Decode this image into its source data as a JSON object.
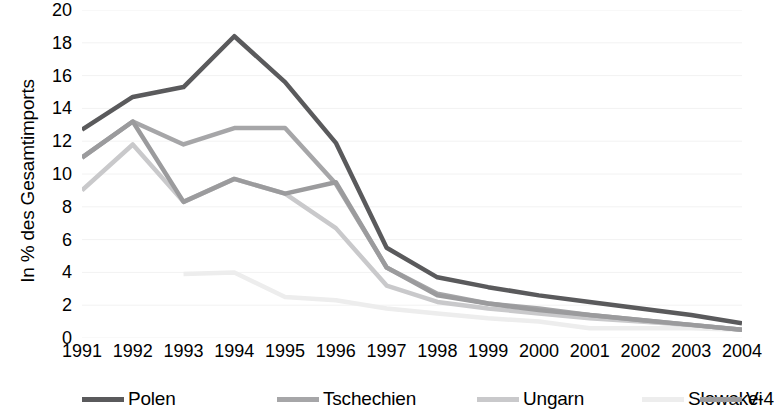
{
  "chart_data": {
    "type": "line",
    "title": "",
    "xlabel": "",
    "ylabel": "In % des Gesamtimports",
    "x": [
      1991,
      1992,
      1993,
      1994,
      1995,
      1996,
      1997,
      1998,
      1999,
      2000,
      2001,
      2002,
      2003,
      2004
    ],
    "categories": [
      "1991",
      "1992",
      "1993",
      "1994",
      "1995",
      "1996",
      "1997",
      "1998",
      "1999",
      "2000",
      "2001",
      "2002",
      "2003",
      "2004"
    ],
    "xlim": [
      1991,
      2004
    ],
    "ylim": [
      0,
      20
    ],
    "yticks": [
      0,
      2,
      4,
      6,
      8,
      10,
      12,
      14,
      16,
      18,
      20
    ],
    "ytick_labels": [
      "0",
      "2",
      "4",
      "6",
      "8",
      "10",
      "12",
      "14",
      "16",
      "18",
      "20"
    ],
    "grid": true,
    "grid_axis": "y",
    "legend_position": "bottom",
    "series": [
      {
        "name": "Polen",
        "color": "#5A5A5C",
        "values": [
          12.7,
          14.7,
          15.3,
          18.4,
          15.6,
          11.9,
          5.5,
          3.7,
          3.1,
          2.6,
          2.2,
          1.8,
          1.4,
          0.9
        ]
      },
      {
        "name": "Tschechien",
        "color": "#A6A6A8",
        "values": [
          11.0,
          13.2,
          11.8,
          12.8,
          12.8,
          9.4,
          4.3,
          2.7,
          2.1,
          1.8,
          1.4,
          1.1,
          0.8,
          0.5
        ]
      },
      {
        "name": "Ungarn",
        "color": "#C9C9CB",
        "values": [
          9.0,
          11.8,
          8.3,
          9.7,
          8.8,
          6.7,
          3.2,
          2.2,
          1.8,
          1.5,
          1.2,
          1.0,
          0.8,
          0.5
        ]
      },
      {
        "name": "Slowakei",
        "color": "#EDEDED",
        "values": [
          null,
          null,
          3.9,
          4.0,
          2.5,
          2.3,
          1.8,
          1.5,
          1.2,
          1.0,
          0.6,
          0.6,
          0.6,
          0.5
        ]
      },
      {
        "name": "V-4",
        "color": "#9B9B9D",
        "values": [
          11.0,
          13.2,
          8.3,
          9.7,
          8.8,
          9.5,
          4.3,
          2.6,
          2.1,
          1.7,
          1.4,
          1.1,
          0.8,
          0.5
        ]
      }
    ]
  },
  "legend": {
    "items": [
      {
        "label": "Polen"
      },
      {
        "label": "Tschechien"
      },
      {
        "label": "Ungarn"
      },
      {
        "label": "Slowakei"
      },
      {
        "label": "V-4"
      }
    ]
  }
}
